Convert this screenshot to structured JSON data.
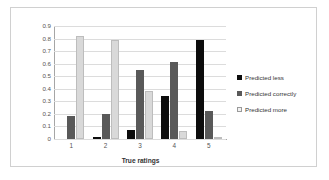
{
  "chart_data": {
    "type": "bar",
    "title": "",
    "xlabel": "True ratings",
    "ylabel": "",
    "categories": [
      "1",
      "2",
      "3",
      "4",
      "5"
    ],
    "series": [
      {
        "name": "Predicted less",
        "color": "#0d0d0d",
        "values": [
          0.0,
          0.02,
          0.07,
          0.34,
          0.79
        ]
      },
      {
        "name": "Predicted correctly",
        "color": "#595959",
        "values": [
          0.18,
          0.2,
          0.55,
          0.61,
          0.22
        ]
      },
      {
        "name": "Predicted more",
        "color": "#d9d9d9",
        "values": [
          0.82,
          0.79,
          0.38,
          0.06,
          0.0
        ]
      }
    ],
    "ylim": [
      0,
      0.9
    ],
    "yticks": [
      "0",
      "0.1",
      "0.2",
      "0.3",
      "0.4",
      "0.5",
      "0.6",
      "0.7",
      "0.8",
      "0.9"
    ],
    "grid": true,
    "legend_position": "right"
  },
  "axis": {
    "y_labels": [
      "0.9",
      "0.8",
      "0.7",
      "0.6",
      "0.5",
      "0.4",
      "0.3",
      "0.2",
      "0.1",
      "0"
    ],
    "x_labels": [
      "1",
      "2",
      "3",
      "4",
      "5"
    ],
    "x_title": "True ratings"
  },
  "legend": {
    "items": [
      {
        "label": "Predicted less",
        "swatch": "legend-swatch-black"
      },
      {
        "label": "Predicted correctly",
        "swatch": "legend-swatch-darkgray"
      },
      {
        "label": "Predicted more",
        "swatch": "legend-swatch-lightgray"
      }
    ]
  }
}
